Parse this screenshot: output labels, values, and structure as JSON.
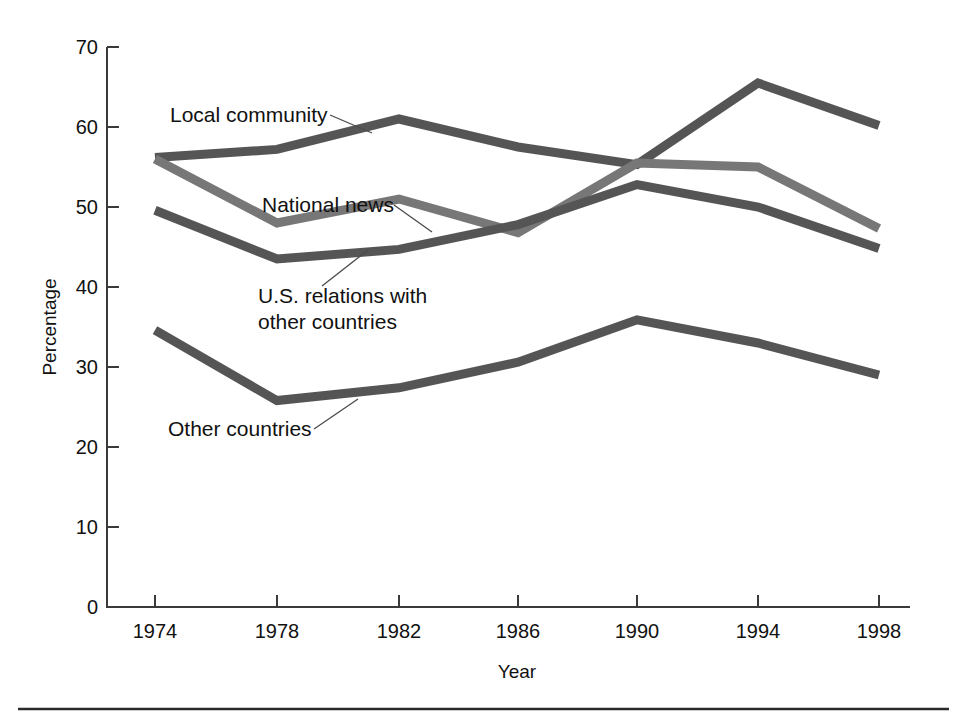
{
  "chart_data": {
    "type": "line",
    "title": "",
    "xlabel": "Year",
    "ylabel": "Percentage",
    "categories": [
      1974,
      1978,
      1982,
      1986,
      1990,
      1994,
      1998
    ],
    "x_tick_labels": [
      "1974",
      "1978",
      "1982",
      "1986",
      "1990",
      "1994",
      "1998"
    ],
    "y_tick_labels": [
      "0",
      "10",
      "20",
      "30",
      "40",
      "50",
      "60",
      "70"
    ],
    "y_ticks": [
      0,
      10,
      20,
      30,
      40,
      50,
      60,
      70
    ],
    "ylim": [
      0,
      70
    ],
    "xlim": [
      1974,
      1998
    ],
    "grid": false,
    "legend_position": "inline-annotations",
    "series": [
      {
        "name": "Local community",
        "color": "#555555",
        "values": [
          56.2,
          57.2,
          61.0,
          57.5,
          55.3,
          65.5,
          60.2
        ]
      },
      {
        "name": "National news",
        "color": "#777777",
        "values": [
          56.0,
          48.0,
          51.0,
          46.8,
          55.5,
          55.0,
          47.3
        ]
      },
      {
        "name": "U.S. relations with other countries",
        "color": "#555555",
        "values": [
          49.6,
          43.5,
          44.7,
          47.8,
          52.8,
          50.0,
          44.8
        ]
      },
      {
        "name": "Other countries",
        "color": "#555555",
        "values": [
          34.6,
          25.8,
          27.4,
          30.6,
          35.9,
          33.0,
          29.0
        ]
      }
    ],
    "annotations": [
      {
        "text": "Local community",
        "x": 170,
        "y": 122
      },
      {
        "text": "National news",
        "x": 262,
        "y": 212
      },
      {
        "text": "U.S. relations with",
        "x": 258,
        "y": 303
      },
      {
        "text": "other countries",
        "x": 258,
        "y": 329
      },
      {
        "text": "Other countries",
        "x": 168,
        "y": 436
      }
    ]
  },
  "colors": {
    "background": "#ffffff",
    "axis": "#3a3a3a",
    "text": "#111111",
    "series_dark": "#555555",
    "series_light": "#777777",
    "rule": "#2a2a2a"
  }
}
